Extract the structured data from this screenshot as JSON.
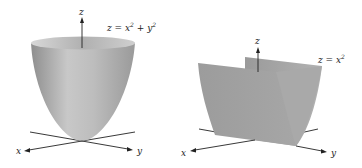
{
  "figures": [
    {
      "id": "paraboloid",
      "equation": "z = x² + y²",
      "eq_base": "z = x",
      "eq_mid": " + y",
      "sup": "2",
      "axes": {
        "x": "x",
        "y": "y",
        "z": "z"
      }
    },
    {
      "id": "parabolic-cylinder",
      "equation": "z = x²",
      "eq_base": "z = x",
      "sup": "2",
      "axes": {
        "x": "x",
        "y": "y",
        "z": "z"
      }
    }
  ],
  "colors": {
    "surface_light": "#d4d4d4",
    "surface_mid": "#a8a8a8",
    "surface_dark": "#8a8a8a",
    "axis": "#222222"
  }
}
